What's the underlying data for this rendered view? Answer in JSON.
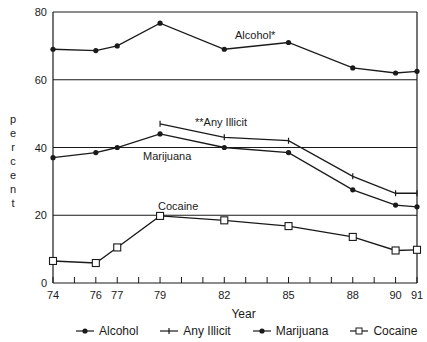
{
  "chart_data": {
    "type": "line",
    "title": "",
    "xlabel": "Year",
    "ylabel": "percent",
    "x": [
      74,
      76,
      77,
      79,
      82,
      85,
      88,
      90,
      91
    ],
    "x_tick_labels": [
      "74",
      "76",
      "77",
      "79",
      "82",
      "85",
      "88",
      "90",
      "91"
    ],
    "y_tick_labels": [
      "0",
      "20",
      "40",
      "60",
      "80"
    ],
    "ylim": [
      0,
      80
    ],
    "xlim": [
      74,
      91
    ],
    "grid": "horizontal lines at 20, 40, 60, 80",
    "legend_position": "bottom",
    "series": [
      {
        "name": "Alcohol",
        "marker": "filled-dot",
        "values": [
          69,
          68.6,
          70,
          76.7,
          69,
          71,
          63.5,
          62,
          62.5
        ]
      },
      {
        "name": "Any Illicit",
        "marker": "plus",
        "values": [
          null,
          null,
          null,
          47,
          43,
          42,
          31.5,
          26.5,
          26.5
        ]
      },
      {
        "name": "Marijuana",
        "marker": "filled-dot",
        "values": [
          37,
          38.5,
          40,
          44,
          40,
          38.5,
          27.5,
          23,
          22.5
        ]
      },
      {
        "name": "Cocaine",
        "marker": "open-square",
        "values": [
          6.5,
          5.9,
          10.5,
          19.8,
          18.5,
          16.8,
          13.6,
          9.6,
          9.8
        ]
      }
    ],
    "annotations": [
      "Alcohol*",
      "**Any Illicit",
      "Marijuana",
      "Cocaine"
    ]
  },
  "labels": {
    "ylabel_letters": [
      "p",
      "e",
      "r",
      "c",
      "e",
      "n",
      "t"
    ],
    "xlabel": "Year",
    "annotation_alcohol": "Alcohol*",
    "annotation_any_illicit": "**Any Illicit",
    "annotation_marijuana": "Marijuana",
    "annotation_cocaine": "Cocaine"
  },
  "legend": [
    {
      "label": "Alcohol",
      "marker": "filled-dot"
    },
    {
      "label": "Any Illicit",
      "marker": "plus"
    },
    {
      "label": "Marijuana",
      "marker": "filled-dot"
    },
    {
      "label": "Cocaine",
      "marker": "open-square"
    }
  ]
}
